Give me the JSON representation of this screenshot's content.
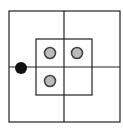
{
  "canvas": {
    "width": 123,
    "height": 131,
    "background": "#ffffff"
  },
  "colors": {
    "line": "#222222",
    "black_dot": "#111111",
    "gray_fill": "#bbbbbb",
    "gray_stroke": "#444444"
  },
  "outer_square": {
    "x": 9,
    "y": 11,
    "width": 111,
    "height": 111
  },
  "inner_square": {
    "x": 36,
    "y": 39,
    "width": 56,
    "height": 56
  },
  "center_lines": {
    "vertical_x": 64,
    "horizontal_y": 67
  },
  "black_dot": {
    "cx": 21,
    "cy": 68,
    "r": 6
  },
  "gray_dots": [
    {
      "cx": 50,
      "cy": 53,
      "r": 5.5
    },
    {
      "cx": 77,
      "cy": 53,
      "r": 5.5
    },
    {
      "cx": 50,
      "cy": 81,
      "r": 5.5
    }
  ]
}
